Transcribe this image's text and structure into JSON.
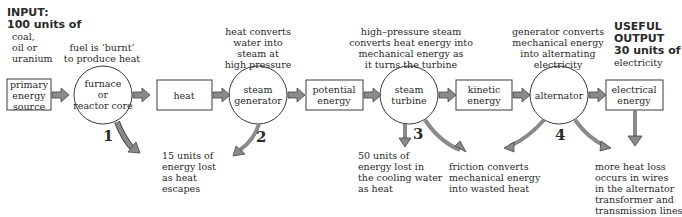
{
  "input": {
    "heading1": "INPUT:",
    "heading2": "100 units of",
    "lines": [
      "coal,",
      "oil or",
      "uranium"
    ]
  },
  "output": {
    "heading1": "USEFUL",
    "heading2": "OUTPUT",
    "heading3": "30 units of",
    "line": "electricity"
  },
  "nodes": [
    {
      "id": "primary",
      "shape": "box",
      "lines": [
        "primary",
        "energy",
        "source"
      ]
    },
    {
      "id": "furnace",
      "shape": "circle",
      "lines": [
        "furnace",
        "or",
        "reactor core"
      ]
    },
    {
      "id": "heat",
      "shape": "box",
      "lines": [
        "heat"
      ]
    },
    {
      "id": "steam-generator",
      "shape": "circle",
      "lines": [
        "steam",
        "generator"
      ]
    },
    {
      "id": "potential",
      "shape": "box",
      "lines": [
        "potential",
        "energy"
      ]
    },
    {
      "id": "steam-turbine",
      "shape": "circle",
      "lines": [
        "steam",
        "turbine"
      ]
    },
    {
      "id": "kinetic",
      "shape": "box",
      "lines": [
        "kinetic",
        "energy"
      ]
    },
    {
      "id": "alternator",
      "shape": "circle",
      "lines": [
        "alternator"
      ]
    },
    {
      "id": "electrical",
      "shape": "box",
      "lines": [
        "electrical",
        "energy"
      ]
    }
  ],
  "captions": {
    "furnace": [
      "fuel is ‘burnt’",
      "to produce heat"
    ],
    "steam_generator": [
      "heat converts",
      "water into",
      "steam at",
      "high pressure"
    ],
    "steam_turbine": [
      "high–pressure steam",
      "converts heat energy into",
      "mechanical energy as",
      "it turns the turbine"
    ],
    "alternator": [
      "generator converts",
      "mechanical energy",
      "into alternating",
      "electricity"
    ]
  },
  "losses": [
    {
      "number": "1",
      "lines": [
        "15 units of",
        "energy lost",
        "as heat",
        "escapes"
      ]
    },
    {
      "number": "2",
      "lines": []
    },
    {
      "number": "3",
      "lines": [
        "50 units of",
        "energy lost in",
        "the cooling water",
        "as heat"
      ]
    },
    {
      "number": "",
      "lines": [
        "friction converts",
        "mechanical energy",
        "into wasted heat"
      ]
    },
    {
      "number": "4",
      "lines": [
        "more heat loss",
        "occurs in wires",
        "in the alternator",
        "transformer and",
        "transmission lines"
      ]
    }
  ],
  "colors": {
    "stroke": "#3a3a3a",
    "arrow_fill": "#8a8a8a"
  }
}
